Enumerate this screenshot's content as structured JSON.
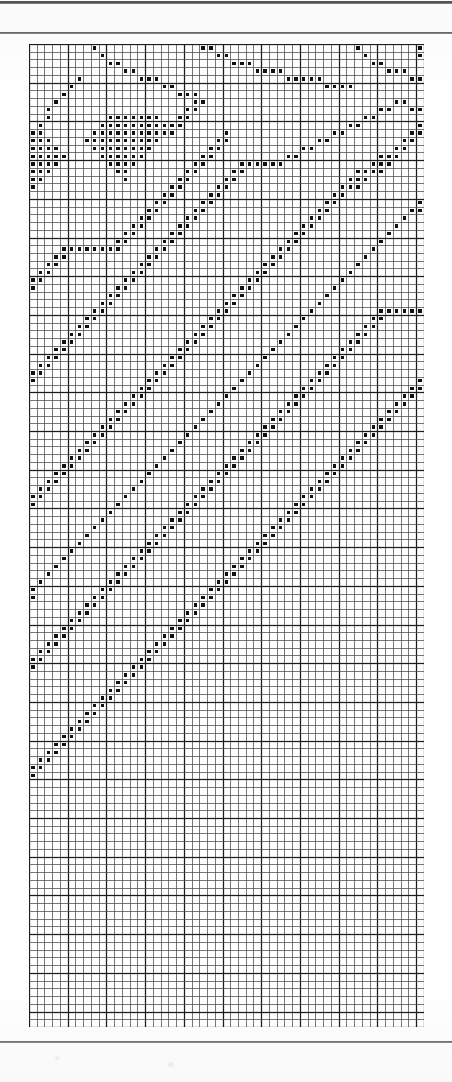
{
  "document": {
    "kind": "counted-thread pattern chart",
    "page_background": "#fefefe",
    "ink_color": "#111111",
    "grid_line_color": "#4a4a4a",
    "bold_line_color": "#1c1c1c"
  },
  "rules": [
    {
      "name": "top-edge-rule",
      "y": 1,
      "height": 3
    },
    {
      "name": "header-rule",
      "y": 32,
      "height": 2
    },
    {
      "name": "footer-rule",
      "y": 1041,
      "height": 2
    }
  ],
  "chart_data": {
    "type": "heatmap",
    "title": "",
    "subtitle": "",
    "xlabel": "",
    "ylabel": "",
    "grid": true,
    "legend": null,
    "columns": 51,
    "rows": 127,
    "cell_px": 7.74,
    "bold_every": 5,
    "origin_px": {
      "x": 30,
      "y": 45
    },
    "symbol": "filled-square",
    "symbol_size_px": 3.4,
    "values_encoding": "row-wise list of filled column indices (0-based)",
    "filled": [
      [
        8,
        22,
        23,
        42,
        50
      ],
      [
        9,
        24,
        25,
        43,
        50
      ],
      [
        10,
        11,
        26,
        27,
        28,
        44,
        45
      ],
      [
        12,
        13,
        29,
        30,
        31,
        32,
        46,
        47,
        48
      ],
      [
        6,
        14,
        15,
        16,
        33,
        34,
        35,
        36,
        37,
        49,
        50
      ],
      [
        5,
        17,
        18,
        38,
        39,
        40,
        41
      ],
      [
        4,
        19,
        20,
        21
      ],
      [
        3,
        21,
        22,
        47,
        48
      ],
      [
        2,
        20,
        21,
        45,
        46,
        49,
        50
      ],
      [
        2,
        10,
        11,
        12,
        13,
        14,
        15,
        16,
        19,
        20,
        43,
        44
      ],
      [
        1,
        9,
        10,
        11,
        12,
        13,
        14,
        15,
        16,
        17,
        18,
        19,
        41,
        42,
        50
      ],
      [
        0,
        1,
        8,
        9,
        10,
        11,
        12,
        13,
        14,
        15,
        16,
        17,
        18,
        25,
        39,
        40,
        49,
        50
      ],
      [
        0,
        1,
        2,
        7,
        8,
        9,
        10,
        11,
        12,
        13,
        14,
        15,
        16,
        24,
        25,
        37,
        38,
        48,
        49
      ],
      [
        0,
        1,
        2,
        3,
        8,
        9,
        10,
        11,
        12,
        13,
        14,
        15,
        23,
        24,
        35,
        36,
        47,
        48
      ],
      [
        0,
        1,
        2,
        3,
        4,
        9,
        10,
        11,
        12,
        13,
        14,
        22,
        23,
        33,
        34,
        45,
        46,
        47
      ],
      [
        0,
        1,
        2,
        3,
        10,
        11,
        12,
        13,
        21,
        22,
        27,
        28,
        29,
        30,
        31,
        32,
        44,
        45,
        46
      ],
      [
        0,
        1,
        2,
        11,
        12,
        20,
        21,
        26,
        27,
        42,
        43,
        44,
        45
      ],
      [
        0,
        1,
        12,
        19,
        20,
        25,
        26,
        41,
        42,
        43
      ],
      [
        0,
        18,
        19,
        24,
        25,
        40,
        41,
        42
      ],
      [
        17,
        18,
        23,
        24,
        39,
        40
      ],
      [
        16,
        17,
        22,
        23,
        38,
        39,
        50
      ],
      [
        15,
        16,
        21,
        22,
        37,
        38,
        49,
        50
      ],
      [
        14,
        15,
        20,
        21,
        36,
        37,
        48
      ],
      [
        13,
        14,
        19,
        20,
        35,
        36,
        47
      ],
      [
        12,
        13,
        18,
        19,
        34,
        35,
        46
      ],
      [
        11,
        12,
        17,
        18,
        33,
        34,
        45
      ],
      [
        4,
        5,
        6,
        7,
        8,
        9,
        10,
        11,
        16,
        17,
        32,
        33,
        44
      ],
      [
        3,
        4,
        15,
        16,
        31,
        32,
        43
      ],
      [
        2,
        3,
        14,
        15,
        30,
        31,
        42
      ],
      [
        1,
        2,
        13,
        14,
        29,
        30,
        41
      ],
      [
        0,
        1,
        12,
        13,
        28,
        29,
        40
      ],
      [
        0,
        11,
        12,
        27,
        28,
        39
      ],
      [
        10,
        11,
        26,
        27,
        38
      ],
      [
        9,
        10,
        25,
        26,
        37
      ],
      [
        8,
        9,
        24,
        25,
        36,
        45,
        46,
        47,
        48,
        49,
        50
      ],
      [
        7,
        8,
        23,
        24,
        35,
        44,
        45
      ],
      [
        6,
        7,
        22,
        23,
        34,
        43,
        44
      ],
      [
        5,
        6,
        21,
        22,
        33,
        42,
        43
      ],
      [
        4,
        5,
        20,
        21,
        32,
        41,
        42
      ],
      [
        3,
        4,
        19,
        20,
        31,
        40,
        41
      ],
      [
        2,
        3,
        18,
        19,
        30,
        39,
        40
      ],
      [
        1,
        2,
        17,
        18,
        29,
        38,
        39
      ],
      [
        0,
        1,
        16,
        17,
        28,
        37,
        38
      ],
      [
        0,
        15,
        16,
        27,
        36,
        37,
        50
      ],
      [
        14,
        15,
        26,
        35,
        36,
        49,
        50
      ],
      [
        13,
        14,
        25,
        34,
        35,
        48,
        49
      ],
      [
        12,
        13,
        24,
        33,
        34,
        47,
        48
      ],
      [
        11,
        12,
        23,
        32,
        33,
        46,
        47
      ],
      [
        10,
        11,
        22,
        31,
        32,
        45,
        46
      ],
      [
        9,
        10,
        21,
        30,
        31,
        44,
        45
      ],
      [
        8,
        9,
        20,
        29,
        30,
        43,
        44
      ],
      [
        7,
        8,
        19,
        28,
        29,
        42,
        43
      ],
      [
        6,
        7,
        18,
        27,
        28,
        41,
        42
      ],
      [
        5,
        6,
        17,
        26,
        27,
        40,
        41
      ],
      [
        4,
        5,
        16,
        25,
        26,
        39,
        40
      ],
      [
        3,
        4,
        15,
        24,
        25,
        38,
        39
      ],
      [
        2,
        3,
        14,
        23,
        24,
        37,
        38
      ],
      [
        1,
        2,
        13,
        22,
        23,
        36,
        37
      ],
      [
        0,
        1,
        12,
        21,
        22,
        35,
        36
      ],
      [
        0,
        11,
        20,
        21,
        34,
        35
      ],
      [
        10,
        19,
        20,
        33,
        34
      ],
      [
        9,
        18,
        19,
        32,
        33
      ],
      [
        8,
        17,
        18,
        31,
        32
      ],
      [
        7,
        16,
        17,
        30,
        31
      ],
      [
        6,
        15,
        16,
        29,
        30
      ],
      [
        5,
        14,
        15,
        28,
        29
      ],
      [
        4,
        13,
        14,
        27,
        28
      ],
      [
        3,
        12,
        13,
        26,
        27
      ],
      [
        2,
        11,
        12,
        25,
        26
      ],
      [
        1,
        10,
        11,
        24,
        25
      ],
      [
        0,
        9,
        10,
        23,
        24
      ],
      [
        0,
        8,
        9,
        22,
        23
      ],
      [
        7,
        8,
        21,
        22
      ],
      [
        6,
        7,
        20,
        21
      ],
      [
        5,
        6,
        19,
        20
      ],
      [
        4,
        5,
        18,
        19
      ],
      [
        3,
        4,
        17,
        18
      ],
      [
        2,
        3,
        16,
        17
      ],
      [
        1,
        2,
        15,
        16
      ],
      [
        0,
        1,
        14,
        15
      ],
      [
        0,
        13,
        14
      ],
      [
        12,
        13
      ],
      [
        11,
        12
      ],
      [
        10,
        11
      ],
      [
        9,
        10
      ],
      [
        8,
        9
      ],
      [
        7,
        8
      ],
      [
        6,
        7
      ],
      [
        5,
        6
      ],
      [
        4,
        5
      ],
      [
        3,
        4
      ],
      [
        2,
        3
      ],
      [
        1,
        2
      ],
      [
        0,
        1
      ],
      [
        0
      ],
      [],
      [],
      [],
      [],
      [],
      [],
      [],
      [],
      [],
      [],
      [],
      [],
      [],
      [],
      [],
      [],
      [],
      [],
      [],
      [],
      [],
      [],
      [],
      [],
      [],
      [],
      [],
      [],
      [],
      [],
      []
    ]
  }
}
